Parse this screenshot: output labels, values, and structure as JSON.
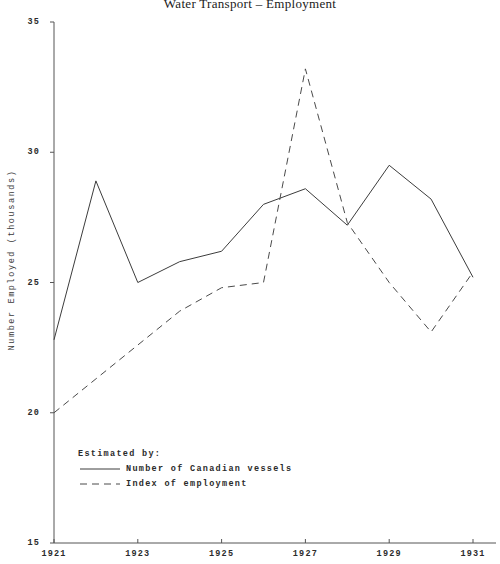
{
  "chart_data": {
    "type": "line",
    "title": "Water Transport – Employment",
    "xlabel": "",
    "ylabel": "Number Employed (thousands)",
    "x": [
      1921,
      1922,
      1923,
      1924,
      1925,
      1926,
      1927,
      1928,
      1929,
      1930,
      1931
    ],
    "xlim": [
      1921,
      1931
    ],
    "ylim": [
      15,
      35
    ],
    "xticks": [
      "1921",
      "1923",
      "1925",
      "1927",
      "1929",
      "1931"
    ],
    "xtick_values": [
      1921,
      1923,
      1925,
      1927,
      1929,
      1931
    ],
    "yticks": [
      "15",
      "20",
      "25",
      "30",
      "35"
    ],
    "ytick_values": [
      15,
      20,
      25,
      30,
      35
    ],
    "grid": false,
    "legend_position": "lower-left",
    "legend_title": "Estimated by:",
    "series": [
      {
        "name": "Number of Canadian vessels",
        "style": "solid",
        "color": "#3c3c3c",
        "values": [
          22.8,
          28.9,
          25.0,
          25.8,
          26.2,
          28.0,
          28.6,
          27.2,
          29.5,
          28.2,
          25.2
        ]
      },
      {
        "name": "Index of employment",
        "style": "dashed",
        "color": "#4a4a4a",
        "values": [
          20.0,
          21.3,
          22.6,
          23.9,
          24.8,
          25.0,
          33.2,
          27.3,
          25.0,
          23.1,
          25.4
        ]
      }
    ]
  },
  "axes": {
    "axis_color": "#555555"
  }
}
